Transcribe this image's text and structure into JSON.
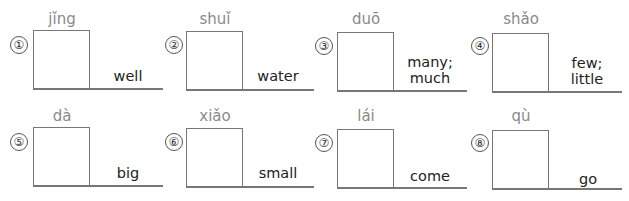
{
  "worksheet": {
    "items": [
      {
        "number": "①",
        "pinyin": "jǐng",
        "meaning_lines": [
          "well"
        ]
      },
      {
        "number": "②",
        "pinyin": "shuǐ",
        "meaning_lines": [
          "water"
        ]
      },
      {
        "number": "③",
        "pinyin": "duō",
        "meaning_lines": [
          "many;",
          "much"
        ]
      },
      {
        "number": "④",
        "pinyin": "shǎo",
        "meaning_lines": [
          "few;",
          "little"
        ]
      },
      {
        "number": "⑤",
        "pinyin": "dà",
        "meaning_lines": [
          "big"
        ]
      },
      {
        "number": "⑥",
        "pinyin": "xiǎo",
        "meaning_lines": [
          "small"
        ]
      },
      {
        "number": "⑦",
        "pinyin": "lái",
        "meaning_lines": [
          "come"
        ]
      },
      {
        "number": "⑧",
        "pinyin": "qù",
        "meaning_lines": [
          "go"
        ]
      }
    ]
  }
}
